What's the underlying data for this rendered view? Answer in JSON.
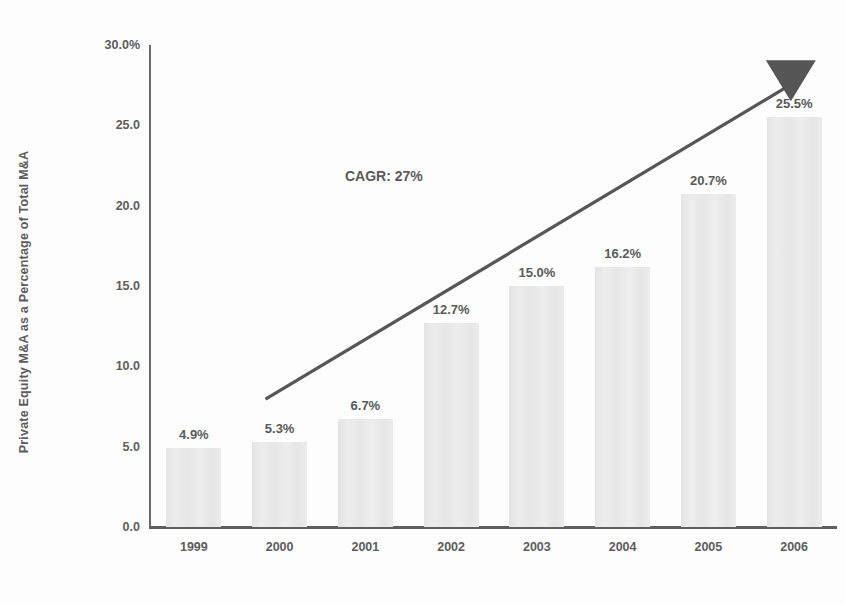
{
  "chart_data": {
    "type": "bar",
    "title": "",
    "xlabel": "",
    "ylabel": "Private Equity M&A as a Percentage of Total M&A",
    "categories": [
      "1999",
      "2000",
      "2001",
      "2002",
      "2003",
      "2004",
      "2005",
      "2006"
    ],
    "values": [
      4.9,
      5.3,
      6.7,
      12.7,
      15.0,
      16.2,
      20.7,
      25.5
    ],
    "value_labels": [
      "4.9%",
      "5.3%",
      "6.7%",
      "12.7%",
      "15.0%",
      "16.2%",
      "20.7%",
      "25.5%"
    ],
    "ylim": [
      0,
      30
    ],
    "ytick_values": [
      30.0,
      25.0,
      20.0,
      15.0,
      10.0,
      5.0,
      0.0
    ],
    "ytick_labels": [
      "30.0%",
      "25.0",
      "20.0",
      "15.0",
      "10.0",
      "5.0",
      "0.0"
    ],
    "grid": false,
    "legend": false,
    "legend_position": "none",
    "annotations": [
      {
        "name": "cagr-annotation",
        "text": "CAGR: 27%",
        "x_value": 2001.8,
        "y_value": 22.0
      },
      {
        "name": "trend-arrow",
        "text": "",
        "from": {
          "x_value": 1999.85,
          "y_value": 8.0
        },
        "to": {
          "x_value": 2005.95,
          "y_value": 27.5
        },
        "style": "arrow",
        "head": "triangle-down"
      }
    ],
    "colors": {
      "bar_fill": "#e9e9e9",
      "axis": "#5f5f5f",
      "text": "#5a5a5a",
      "arrow": "#565656",
      "background": "#fdfdfd"
    }
  }
}
